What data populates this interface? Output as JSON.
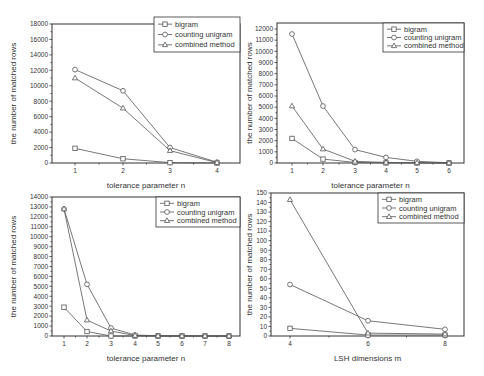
{
  "chart_data": [
    {
      "type": "line",
      "title": "",
      "xlabel": "tolerance parameter n",
      "ylabel": "the number of matched rows",
      "x": [
        1,
        2,
        3,
        4
      ],
      "xticks": [
        1,
        2,
        3,
        4
      ],
      "yticks": [
        0,
        2000,
        4000,
        6000,
        8000,
        10000,
        12000,
        14000,
        16000,
        18000
      ],
      "ylim": [
        0,
        18000
      ],
      "legend_position": "top-right",
      "grid": false,
      "series": [
        {
          "name": "bigram",
          "marker": "square",
          "values": [
            1900,
            550,
            50,
            0
          ]
        },
        {
          "name": "counting unigram",
          "marker": "circle",
          "values": [
            12100,
            9350,
            2000,
            100
          ]
        },
        {
          "name": "combined method",
          "marker": "triangle",
          "values": [
            11000,
            7100,
            1600,
            50
          ]
        }
      ]
    },
    {
      "type": "line",
      "title": "",
      "xlabel": "tolerance parameter n",
      "ylabel": "the number of matched rows",
      "x": [
        1,
        2,
        3,
        4,
        5,
        6
      ],
      "xticks": [
        1,
        2,
        3,
        4,
        5,
        6
      ],
      "yticks": [
        0,
        1000,
        2000,
        3000,
        4000,
        5000,
        6000,
        7000,
        8000,
        9000,
        10000,
        11000,
        12000
      ],
      "ylim": [
        0,
        12400
      ],
      "legend_position": "top-right",
      "grid": false,
      "series": [
        {
          "name": "bigram",
          "marker": "square",
          "values": [
            2200,
            350,
            50,
            10,
            5,
            0
          ]
        },
        {
          "name": "counting unigram",
          "marker": "circle",
          "values": [
            11550,
            5100,
            1200,
            500,
            150,
            20
          ]
        },
        {
          "name": "combined method",
          "marker": "triangle",
          "values": [
            5100,
            1250,
            150,
            50,
            20,
            0
          ]
        }
      ]
    },
    {
      "type": "line",
      "title": "",
      "xlabel": "tolerance parameter n",
      "ylabel": "the number of matched rows",
      "x": [
        1,
        2,
        3,
        4,
        5,
        6,
        7,
        8
      ],
      "xticks": [
        1,
        2,
        3,
        4,
        5,
        6,
        7,
        8
      ],
      "yticks": [
        0,
        1000,
        2000,
        3000,
        4000,
        5000,
        6000,
        7000,
        8000,
        9000,
        10000,
        11000,
        12000,
        13000,
        14000
      ],
      "ylim": [
        0,
        14000
      ],
      "legend_position": "top-right",
      "grid": false,
      "series": [
        {
          "name": "bigram",
          "marker": "square",
          "values": [
            2900,
            450,
            0,
            0,
            0,
            0,
            0,
            0
          ]
        },
        {
          "name": "counting unigram",
          "marker": "circle",
          "values": [
            12800,
            5200,
            800,
            100,
            20,
            10,
            5,
            0
          ]
        },
        {
          "name": "combined method",
          "marker": "triangle",
          "values": [
            12800,
            1600,
            500,
            50,
            10,
            5,
            0,
            0
          ]
        }
      ]
    },
    {
      "type": "line",
      "title": "",
      "xlabel": "LSH dimensions m",
      "ylabel": "the number of matched rows",
      "x": [
        4,
        6,
        8
      ],
      "xticks": [
        4,
        6,
        8
      ],
      "yticks": [
        0,
        10,
        20,
        30,
        40,
        50,
        60,
        70,
        80,
        90,
        100,
        110,
        120,
        130,
        140,
        150
      ],
      "ylim": [
        0,
        150
      ],
      "xlim": [
        3.5,
        8.5
      ],
      "legend_position": "top-right",
      "grid": false,
      "series": [
        {
          "name": "bigram",
          "marker": "square",
          "values": [
            8,
            1,
            1
          ]
        },
        {
          "name": "counting unigram",
          "marker": "circle",
          "values": [
            54,
            16,
            7
          ]
        },
        {
          "name": "combined method",
          "marker": "triangle",
          "values": [
            143,
            3,
            2
          ]
        }
      ]
    }
  ],
  "layout": [
    {
      "left": 52,
      "right": 240,
      "top": 24,
      "bottom": 163,
      "xpx": [
        75,
        123,
        170,
        217
      ],
      "ytop_val": 18000,
      "ytop_px": 24,
      "legend": {
        "x": 154,
        "y": 17,
        "w": 86,
        "h": 35
      }
    },
    {
      "left": 277,
      "right": 464,
      "top": 23,
      "bottom": 163,
      "xpx": [
        292,
        323,
        355,
        386,
        417,
        449
      ],
      "ytop_val": 12000,
      "ytop_px": 29,
      "legend": {
        "x": 383,
        "y": 23,
        "w": 81,
        "h": 29
      }
    },
    {
      "left": 52,
      "right": 240,
      "top": 197,
      "bottom": 336,
      "xpx": [
        64,
        87,
        111,
        135,
        158,
        182,
        205,
        229
      ],
      "ytop_val": 14000,
      "ytop_px": 197,
      "legend": {
        "x": 156,
        "y": 197,
        "w": 84,
        "h": 30
      }
    },
    {
      "left": 271,
      "right": 464,
      "top": 193,
      "bottom": 336,
      "xpx": [
        290,
        368,
        445
      ],
      "ytop_val": 150,
      "ytop_px": 193,
      "legend": {
        "x": 378,
        "y": 193,
        "w": 86,
        "h": 30
      }
    }
  ]
}
